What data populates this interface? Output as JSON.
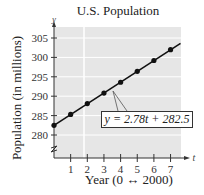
{
  "chart_data": {
    "type": "line",
    "title": "U.S. Population",
    "xlabel": "Year (0 ↔ 2000)",
    "ylabel": "Population (in millions)",
    "x_axis_symbol": "t",
    "y_axis_symbol": "y",
    "x": [
      0,
      1,
      2,
      3,
      4,
      5,
      6,
      7
    ],
    "series": [
      {
        "name": "y = 2.78t + 282.5",
        "values": [
          282.5,
          285.3,
          288.1,
          290.8,
          293.6,
          296.4,
          299.2,
          302.0
        ],
        "markers": true
      }
    ],
    "x_ticks": [
      "1",
      "2",
      "3",
      "4",
      "5",
      "6",
      "7"
    ],
    "y_ticks": [
      "280",
      "285",
      "290",
      "295",
      "300",
      "305"
    ],
    "xlim": [
      0,
      7.7
    ],
    "ylim": [
      280,
      306
    ],
    "y_axis_break": true,
    "grid": "horizontal",
    "annotation": "y = 2.78t + 282.5",
    "legend": "none"
  },
  "colors": {
    "plot_background": "#e6e6e6",
    "grid": "#ffffff",
    "line": "#111111",
    "axis": "#333333"
  }
}
